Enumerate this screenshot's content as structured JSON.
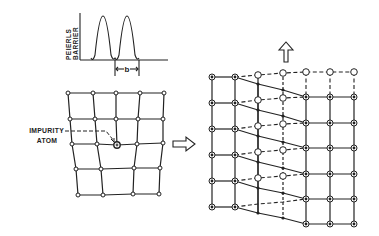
{
  "barrier_plot": {
    "ylabel_line1": "PEIERLS",
    "ylabel_line2": "BARRIER",
    "spacing_label": "b"
  },
  "left_lattice": {
    "impurity_label_line1": "IMPURITY",
    "impurity_label_line2": "ATOM"
  },
  "arrows": {
    "transform_arrow": "right-arrow-icon",
    "motion_arrow": "up-arrow-icon"
  },
  "colors": {
    "ink": "#222222",
    "background": "#ffffff"
  }
}
